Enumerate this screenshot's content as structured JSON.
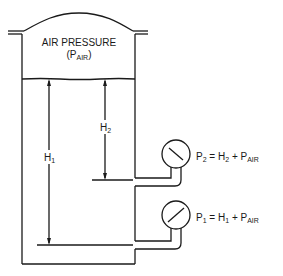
{
  "diagram": {
    "tank_label_line1": "AIR PRESSURE",
    "tank_label_line2_prefix": "(P",
    "tank_label_line2_sub": "AIR",
    "tank_label_line2_suffix": ")",
    "h1_label": "H",
    "h1_sub": "1",
    "h2_label": "H",
    "h2_sub": "2",
    "gauge2": {
      "eq_p": "P",
      "eq_p_sub": "2",
      "eq_mid": " = H",
      "eq_h_sub": "2",
      "eq_plus": " + P",
      "eq_air_sub": "AIR"
    },
    "gauge1": {
      "eq_p": "P",
      "eq_p_sub": "1",
      "eq_mid": " = H",
      "eq_h_sub": "1",
      "eq_plus": " + P",
      "eq_air_sub": "AIR"
    },
    "line_color": "#1a1a1a"
  }
}
